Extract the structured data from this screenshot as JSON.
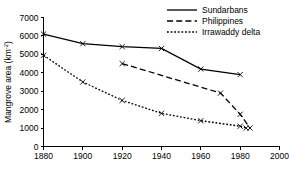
{
  "chart_data": {
    "type": "line",
    "title": "",
    "xlabel": "",
    "ylabel": "Mangrove area (km",
    "ylabel_sup": "-2",
    "ylabel_close": ")",
    "xlim": [
      1880,
      2000
    ],
    "ylim": [
      0,
      7000
    ],
    "xticks": [
      1880,
      1900,
      1920,
      1940,
      1960,
      1980,
      2000
    ],
    "xtick_labels": [
      "1880",
      "1900",
      "1920",
      "1940",
      "1960",
      "1980",
      "2000"
    ],
    "yticks": [
      0,
      1000,
      2000,
      3000,
      4000,
      5000,
      6000,
      7000
    ],
    "ytick_labels": [
      "0",
      "1000",
      "2000",
      "3000",
      "4000",
      "5000",
      "6000",
      "7000"
    ],
    "grid": false,
    "legend_position": "top-right",
    "marker": "x",
    "series": [
      {
        "name": "Sundarbans",
        "style": "solid",
        "x": [
          1880,
          1900,
          1920,
          1940,
          1960,
          1980
        ],
        "values": [
          6100,
          5580,
          5420,
          5320,
          4200,
          3900
        ]
      },
      {
        "name": "Philippines",
        "style": "dashed",
        "x": [
          1920,
          1970,
          1980,
          1985
        ],
        "values": [
          4500,
          2900,
          1750,
          1000
        ]
      },
      {
        "name": "Irrawaddy delta",
        "style": "dotted",
        "x": [
          1880,
          1900,
          1920,
          1940,
          1960,
          1980,
          1983
        ],
        "values": [
          4950,
          3500,
          2500,
          1800,
          1400,
          1100,
          1000
        ]
      }
    ]
  }
}
